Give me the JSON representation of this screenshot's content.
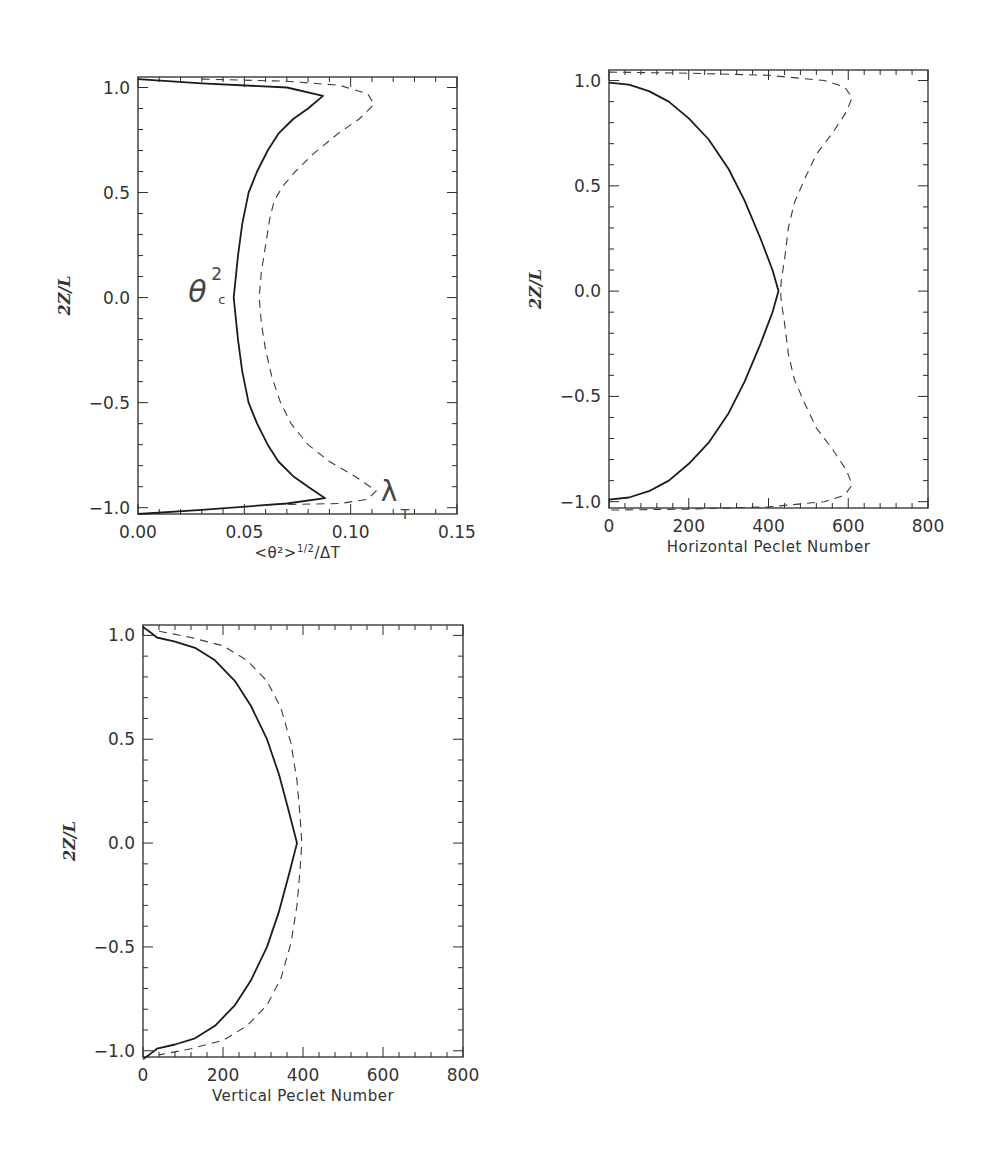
{
  "chart_data": [
    {
      "type": "line",
      "id": "panel-theta",
      "title": "",
      "xlabel": "<θ²>^1/2/ΔT",
      "xlabel_parts": {
        "main": "<θ²>",
        "sup": "1/2",
        "tail": "/ΔT"
      },
      "ylabel": "2Z/L",
      "xlim": [
        0.0,
        0.15
      ],
      "ylim": [
        -1.03,
        1.05
      ],
      "xticks": [
        0.0,
        0.05,
        0.1,
        0.15
      ],
      "xtick_labels": [
        "0.00",
        "0.05",
        "0.10",
        "0.15"
      ],
      "yticks": [
        -1.0,
        -0.5,
        0.0,
        0.5,
        1.0
      ],
      "ytick_labels": [
        "−1.0",
        "−0.5",
        "0.0",
        "0.5",
        "1.0"
      ],
      "grid": false,
      "annotations": [
        {
          "text": "θ",
          "sup": "2",
          "sub": "c",
          "near_series": "theta_c",
          "x": 0.033,
          "y": 0.0
        },
        {
          "text": "λ",
          "sub": "T",
          "near_series": "lambda_T",
          "x": 0.116,
          "y": -0.95
        }
      ],
      "series": [
        {
          "name": "θ²_c",
          "style": "solid",
          "x": [
            0.0,
            0.03,
            0.07,
            0.087,
            0.08,
            0.073,
            0.066,
            0.061,
            0.056,
            0.052,
            0.049,
            0.047,
            0.045,
            0.047,
            0.049,
            0.052,
            0.056,
            0.061,
            0.066,
            0.073,
            0.08,
            0.088,
            0.07,
            0.03,
            0.0
          ],
          "y": [
            1.04,
            1.02,
            1.0,
            0.96,
            0.9,
            0.85,
            0.78,
            0.7,
            0.6,
            0.5,
            0.35,
            0.2,
            0.0,
            -0.2,
            -0.35,
            -0.5,
            -0.6,
            -0.7,
            -0.78,
            -0.85,
            -0.9,
            -0.955,
            -0.98,
            -1.01,
            -1.03
          ]
        },
        {
          "name": "λ_T",
          "style": "dashed",
          "x": [
            0.03,
            0.07,
            0.095,
            0.108,
            0.111,
            0.104,
            0.094,
            0.082,
            0.074,
            0.068,
            0.064,
            0.062,
            0.06,
            0.058,
            0.057,
            0.058,
            0.06,
            0.063,
            0.067,
            0.072,
            0.08,
            0.09,
            0.102,
            0.112,
            0.108,
            0.095,
            0.07
          ],
          "y": [
            1.04,
            1.03,
            1.01,
            0.97,
            0.92,
            0.85,
            0.78,
            0.68,
            0.6,
            0.53,
            0.46,
            0.38,
            0.25,
            0.12,
            0.0,
            -0.12,
            -0.25,
            -0.38,
            -0.5,
            -0.6,
            -0.7,
            -0.78,
            -0.85,
            -0.92,
            -0.96,
            -0.98,
            -0.985
          ]
        }
      ]
    },
    {
      "type": "line",
      "id": "panel-horizontal",
      "title": "",
      "xlabel": "Horizontal Peclet Number",
      "ylabel": "2Z/L",
      "xlim": [
        0,
        800
      ],
      "ylim": [
        -1.03,
        1.05
      ],
      "xticks": [
        0,
        200,
        400,
        600,
        800
      ],
      "xtick_labels": [
        "0",
        "200",
        "400",
        "600",
        "800"
      ],
      "yticks": [
        -1.0,
        -0.5,
        0.0,
        0.5,
        1.0
      ],
      "ytick_labels": [
        "−1.0",
        "−0.5",
        "0.0",
        "0.5",
        "1.0"
      ],
      "grid": false,
      "series": [
        {
          "name": "solid",
          "style": "solid",
          "x": [
            0,
            50,
            100,
            150,
            200,
            250,
            300,
            340,
            380,
            410,
            425,
            410,
            380,
            340,
            300,
            250,
            200,
            150,
            100,
            50,
            0
          ],
          "y": [
            0.99,
            0.98,
            0.95,
            0.9,
            0.82,
            0.72,
            0.58,
            0.43,
            0.25,
            0.1,
            0.0,
            -0.1,
            -0.25,
            -0.43,
            -0.58,
            -0.72,
            -0.82,
            -0.9,
            -0.95,
            -0.98,
            -0.99
          ]
        },
        {
          "name": "dashed",
          "style": "dashed",
          "x": [
            0,
            200,
            400,
            540,
            590,
            610,
            595,
            560,
            520,
            490,
            465,
            450,
            440,
            432,
            430,
            432,
            440,
            450,
            465,
            490,
            520,
            560,
            595,
            610,
            590,
            540,
            400,
            200,
            0
          ],
          "y": [
            1.04,
            1.035,
            1.025,
            1.0,
            0.97,
            0.92,
            0.85,
            0.75,
            0.65,
            0.53,
            0.42,
            0.3,
            0.15,
            0.05,
            0.0,
            -0.05,
            -0.15,
            -0.3,
            -0.42,
            -0.53,
            -0.65,
            -0.75,
            -0.85,
            -0.92,
            -0.97,
            -1.0,
            -1.025,
            -1.035,
            -1.04
          ]
        }
      ]
    },
    {
      "type": "line",
      "id": "panel-vertical",
      "title": "",
      "xlabel": "Vertical Peclet Number",
      "ylabel": "2Z/L",
      "xlim": [
        0,
        800
      ],
      "ylim": [
        -1.03,
        1.05
      ],
      "xticks": [
        0,
        200,
        400,
        600,
        800
      ],
      "xtick_labels": [
        "0",
        "200",
        "400",
        "600",
        "800"
      ],
      "yticks": [
        -1.0,
        -0.5,
        0.0,
        0.5,
        1.0
      ],
      "ytick_labels": [
        "−1.0",
        "−0.5",
        "0.0",
        "0.5",
        "1.0"
      ],
      "grid": false,
      "series": [
        {
          "name": "solid",
          "style": "solid",
          "x": [
            0,
            15,
            35,
            80,
            130,
            180,
            230,
            270,
            310,
            340,
            365,
            385,
            365,
            340,
            310,
            270,
            230,
            180,
            130,
            80,
            35,
            15,
            0
          ],
          "y": [
            1.04,
            1.02,
            0.99,
            0.97,
            0.94,
            0.88,
            0.78,
            0.66,
            0.5,
            0.33,
            0.15,
            0.0,
            -0.15,
            -0.33,
            -0.5,
            -0.66,
            -0.78,
            -0.88,
            -0.94,
            -0.97,
            -0.99,
            -1.02,
            -1.04
          ]
        },
        {
          "name": "dashed",
          "style": "dashed",
          "x": [
            40,
            120,
            200,
            260,
            310,
            345,
            370,
            385,
            393,
            397,
            393,
            385,
            370,
            345,
            310,
            260,
            200,
            120,
            40
          ],
          "y": [
            1.02,
            0.99,
            0.95,
            0.88,
            0.78,
            0.65,
            0.48,
            0.3,
            0.12,
            0.0,
            -0.12,
            -0.3,
            -0.48,
            -0.65,
            -0.78,
            -0.88,
            -0.95,
            -0.99,
            -1.02
          ]
        }
      ]
    }
  ]
}
